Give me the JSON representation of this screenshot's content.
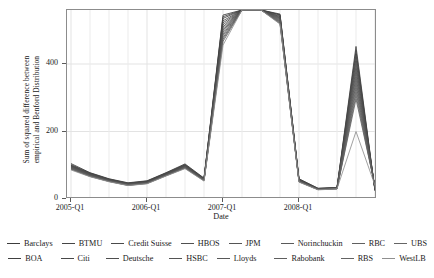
{
  "chart_data": {
    "type": "line",
    "title": "",
    "xlabel": "Date",
    "ylabel": "Sum of squared difference between empirical and Benford Distribution",
    "ylabel_line1": "Sum of squared difference between",
    "ylabel_line2": "empirical and Benford Distribution",
    "ylim": [
      0,
      560
    ],
    "yticks": [
      0,
      200,
      400
    ],
    "ytick_labels": [
      "0",
      "200",
      "400"
    ],
    "xticks": [
      "2005-Q1",
      "2006-Q1",
      "2007-Q1",
      "2008-Q1"
    ],
    "x": [
      "2005-Q1",
      "2005-Q2",
      "2005-Q3",
      "2005-Q4",
      "2006-Q1",
      "2006-Q2",
      "2006-Q3",
      "2006-Q4",
      "2007-Q1",
      "2007-Q2",
      "2007-Q3",
      "2007-Q4",
      "2008-Q1",
      "2008-Q2",
      "2008-Q3",
      "2008-Q4",
      "2009-Q1"
    ],
    "grid": true,
    "legend_position": "bottom",
    "line_color": "#4d4d4d",
    "series": [
      {
        "name": "Barclays",
        "color": "#3c3c3c",
        "values": [
          105,
          78,
          60,
          48,
          54,
          78,
          104,
          62,
          545,
          560,
          560,
          548,
          60,
          32,
          34,
          452,
          24
        ]
      },
      {
        "name": "BTMU",
        "color": "#454545",
        "values": [
          100,
          76,
          58,
          46,
          52,
          76,
          101,
          60,
          540,
          560,
          560,
          545,
          58,
          31,
          33,
          430,
          26
        ]
      },
      {
        "name": "Credit Suisse",
        "color": "#4a4a4a",
        "values": [
          98,
          74,
          57,
          45,
          51,
          74,
          99,
          59,
          528,
          560,
          560,
          540,
          57,
          30,
          33,
          408,
          28
        ]
      },
      {
        "name": "HBOS",
        "color": "#505050",
        "values": [
          96,
          72,
          56,
          44,
          50,
          73,
          97,
          58,
          516,
          560,
          560,
          536,
          55,
          30,
          32,
          385,
          30
        ]
      },
      {
        "name": "JPM",
        "color": "#555555",
        "values": [
          94,
          71,
          55,
          43,
          49,
          72,
          96,
          57,
          505,
          560,
          560,
          532,
          54,
          29,
          32,
          362,
          32
        ]
      },
      {
        "name": "Norinchuckin",
        "color": "#5a5a5a",
        "values": [
          92,
          70,
          54,
          42,
          48,
          71,
          94,
          56,
          495,
          560,
          560,
          528,
          53,
          29,
          31,
          340,
          34
        ]
      },
      {
        "name": "RBC",
        "color": "#606060",
        "values": [
          90,
          68,
          53,
          41,
          47,
          70,
          93,
          55,
          484,
          560,
          560,
          524,
          52,
          28,
          31,
          318,
          36
        ]
      },
      {
        "name": "UBS",
        "color": "#656565",
        "values": [
          88,
          67,
          52,
          40,
          46,
          69,
          91,
          54,
          473,
          560,
          560,
          520,
          51,
          28,
          30,
          296,
          38
        ]
      },
      {
        "name": "BOA",
        "color": "#404040",
        "values": [
          102,
          77,
          59,
          47,
          53,
          77,
          102,
          61,
          535,
          560,
          560,
          546,
          59,
          31,
          34,
          440,
          25
        ]
      },
      {
        "name": "Citi",
        "color": "#484848",
        "values": [
          99,
          75,
          58,
          46,
          52,
          75,
          100,
          60,
          522,
          560,
          560,
          542,
          57,
          30,
          33,
          418,
          27
        ]
      },
      {
        "name": "Deutsche",
        "color": "#4e4e4e",
        "values": [
          97,
          73,
          56,
          45,
          50,
          74,
          98,
          59,
          510,
          560,
          560,
          538,
          56,
          30,
          33,
          396,
          29
        ]
      },
      {
        "name": "HSBC",
        "color": "#535353",
        "values": [
          95,
          71,
          55,
          44,
          49,
          72,
          96,
          58,
          500,
          560,
          560,
          534,
          55,
          29,
          32,
          374,
          31
        ]
      },
      {
        "name": "Lloyds",
        "color": "#585858",
        "values": [
          93,
          70,
          54,
          43,
          48,
          71,
          95,
          57,
          489,
          560,
          560,
          530,
          53,
          29,
          32,
          351,
          33
        ]
      },
      {
        "name": "Rabobank",
        "color": "#5e5e5e",
        "values": [
          91,
          69,
          53,
          42,
          47,
          70,
          93,
          56,
          478,
          560,
          560,
          526,
          52,
          28,
          31,
          329,
          35
        ]
      },
      {
        "name": "RBS",
        "color": "#636363",
        "values": [
          89,
          67,
          52,
          41,
          46,
          69,
          92,
          55,
          467,
          560,
          560,
          522,
          51,
          28,
          30,
          307,
          37
        ]
      },
      {
        "name": "WestLB",
        "color": "#8f8f8f",
        "values": [
          86,
          66,
          51,
          40,
          45,
          68,
          90,
          53,
          456,
          560,
          560,
          518,
          50,
          27,
          30,
          200,
          40
        ]
      }
    ]
  },
  "legend": {
    "row1": [
      "Barclays",
      "BTMU",
      "Credit Suisse",
      "HBOS",
      "JPM",
      "Norinchuckin",
      "RBC",
      "UBS"
    ],
    "row2": [
      "BOA",
      "Citi",
      "Deutsche",
      "HSBC",
      "Lloyds",
      "Rabobank",
      "RBS",
      "WestLB"
    ]
  }
}
